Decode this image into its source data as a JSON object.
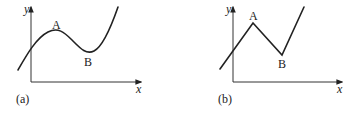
{
  "panels": [
    {
      "id": "a",
      "caption": "(a)",
      "x_axis_label": "x",
      "y_axis_label": "y",
      "curve_type": "smooth",
      "points": [
        {
          "label": "A",
          "kind": "local maximum"
        },
        {
          "label": "B",
          "kind": "local minimum"
        }
      ]
    },
    {
      "id": "b",
      "caption": "(b)",
      "x_axis_label": "x",
      "y_axis_label": "y",
      "curve_type": "piecewise linear (sharp corners)",
      "points": [
        {
          "label": "A",
          "kind": "corner maximum"
        },
        {
          "label": "B",
          "kind": "corner minimum"
        }
      ]
    }
  ],
  "colors": {
    "line": "#222222",
    "axis": "#333333",
    "background": "#ffffff"
  }
}
